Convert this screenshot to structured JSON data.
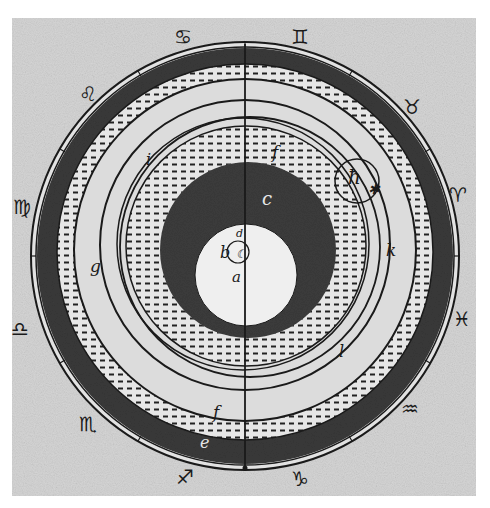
{
  "diagram": {
    "type": "cosmological-diagram",
    "colors": {
      "paper": "#d9d9d9",
      "paper_outer": "#ffffff",
      "ink": "#1a1a1a",
      "dark_band": "#3a3a3a",
      "dotted_band": "#e6e6e6",
      "light_band": "#dcdcdc",
      "center_white": "#efefef",
      "dash": "#222222"
    },
    "center": {
      "x": 245,
      "y": 256
    },
    "outer_radius": 213,
    "zodiac": [
      {
        "name": "cancer",
        "glyph": "♋",
        "x": 183,
        "y": 38
      },
      {
        "name": "gemini",
        "glyph": "♊",
        "x": 300,
        "y": 38
      },
      {
        "name": "taurus",
        "glyph": "♉",
        "x": 412,
        "y": 108
      },
      {
        "name": "leo",
        "glyph": "♌",
        "x": 88,
        "y": 95
      },
      {
        "name": "aries",
        "glyph": "♈",
        "x": 458,
        "y": 196
      },
      {
        "name": "virgo",
        "glyph": "♍",
        "x": 22,
        "y": 208
      },
      {
        "name": "pisces",
        "glyph": "♓",
        "x": 462,
        "y": 320
      },
      {
        "name": "libra",
        "glyph": "♎",
        "x": 20,
        "y": 330
      },
      {
        "name": "aquarius",
        "glyph": "♒",
        "x": 410,
        "y": 410
      },
      {
        "name": "scorpio",
        "glyph": "♏",
        "x": 88,
        "y": 425
      },
      {
        "name": "capricorn",
        "glyph": "♑",
        "x": 300,
        "y": 480
      },
      {
        "name": "sagittarius",
        "glyph": "♐",
        "x": 185,
        "y": 478
      }
    ],
    "letters": [
      {
        "id": "a",
        "text": "a",
        "x": 232,
        "y": 282,
        "size": 15,
        "light": false
      },
      {
        "id": "b",
        "text": "b",
        "x": 220,
        "y": 258,
        "size": 16,
        "light": false
      },
      {
        "id": "d",
        "text": "d",
        "x": 236,
        "y": 237,
        "size": 11,
        "light": false
      },
      {
        "id": "c-top",
        "text": "c",
        "x": 262,
        "y": 205,
        "size": 18,
        "light": true
      },
      {
        "id": "c-bottom",
        "text": "e",
        "x": 200,
        "y": 448,
        "size": 16,
        "light": true
      },
      {
        "id": "f-top",
        "text": "f",
        "x": 272,
        "y": 158,
        "size": 17,
        "light": false
      },
      {
        "id": "f-bottom",
        "text": "f",
        "x": 213,
        "y": 418,
        "size": 17,
        "light": false
      },
      {
        "id": "g",
        "text": "g",
        "x": 90,
        "y": 272,
        "size": 17,
        "light": false
      },
      {
        "id": "i",
        "text": "i",
        "x": 146,
        "y": 165,
        "size": 16,
        "light": false
      },
      {
        "id": "k",
        "text": "k",
        "x": 386,
        "y": 256,
        "size": 17,
        "light": false
      },
      {
        "id": "l",
        "text": "l",
        "x": 339,
        "y": 357,
        "size": 16,
        "light": false
      },
      {
        "id": "h",
        "text": "ħ",
        "x": 348,
        "y": 184,
        "size": 20,
        "light": false
      }
    ],
    "star": {
      "glyph": "✱",
      "x": 368,
      "y": 194
    },
    "moon_symbol": {
      "glyph": "☾",
      "x": 236,
      "y": 258
    }
  }
}
